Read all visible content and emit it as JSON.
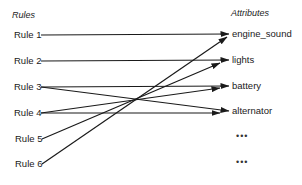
{
  "headings": {
    "rules": "Rules",
    "attributes": "Attributes"
  },
  "rules": [
    {
      "id": "rule1",
      "label": "Rule 1",
      "y": 35
    },
    {
      "id": "rule2",
      "label": "Rule 2",
      "y": 61
    },
    {
      "id": "rule3",
      "label": "Rule 3",
      "y": 87
    },
    {
      "id": "rule4",
      "label": "Rule 4",
      "y": 113
    },
    {
      "id": "rule5",
      "label": "Rule 5",
      "y": 139
    },
    {
      "id": "rule6",
      "label": "Rule 6",
      "y": 164
    }
  ],
  "attributes": [
    {
      "id": "engine_sound",
      "label": "engine_sound",
      "y": 34
    },
    {
      "id": "lights",
      "label": "lights",
      "y": 60
    },
    {
      "id": "battery",
      "label": "battery",
      "y": 86
    },
    {
      "id": "alternator",
      "label": "alternator",
      "y": 111
    },
    {
      "id": "more1",
      "label": "•••",
      "y": 137
    },
    {
      "id": "more2",
      "label": "•••",
      "y": 162
    }
  ],
  "links": [
    {
      "from": "Rule 1",
      "to": "engine_sound"
    },
    {
      "from": "Rule 2",
      "to": "lights"
    },
    {
      "from": "Rule 3",
      "to": "battery"
    },
    {
      "from": "Rule 3",
      "to": "alternator"
    },
    {
      "from": "Rule 4",
      "to": "battery"
    },
    {
      "from": "Rule 4",
      "to": "alternator"
    },
    {
      "from": "Rule 5",
      "to": "lights"
    },
    {
      "from": "Rule 6",
      "to": "engine_sound"
    }
  ],
  "colors": {
    "line": "#1a1a1a",
    "background": "#ffffff"
  }
}
